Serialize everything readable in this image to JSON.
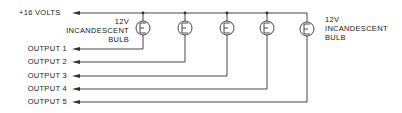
{
  "diagram": {
    "supply_label": "+16 VOLTS",
    "bulb_label_left": [
      "12V",
      "INCANDESCENT",
      "BULB"
    ],
    "bulb_label_right": [
      "12V",
      "INCANDESCENT",
      "BULB"
    ],
    "outputs": [
      "OUTPUT 1",
      "OUTPUT 2",
      "OUTPUT 3",
      "OUTPUT 4",
      "OUTPUT 5"
    ],
    "bulb_count": 5,
    "bulb_symbol": "E"
  }
}
